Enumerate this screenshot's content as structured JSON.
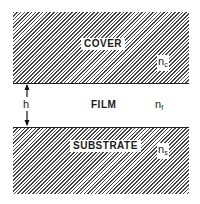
{
  "diagram": {
    "type": "planar-waveguide-cross-section",
    "layers": [
      {
        "id": "cover",
        "label": "COVER",
        "index_symbol": "n",
        "index_sub": "c",
        "pattern": "hatched"
      },
      {
        "id": "film",
        "label": "FILM",
        "index_symbol": "n",
        "index_sub": "f",
        "pattern": "clear"
      },
      {
        "id": "substrate",
        "label": "SUBSTRATE",
        "index_symbol": "n",
        "index_sub": "s",
        "pattern": "hatched"
      }
    ],
    "thickness": {
      "label": "h",
      "spans": "film"
    }
  }
}
